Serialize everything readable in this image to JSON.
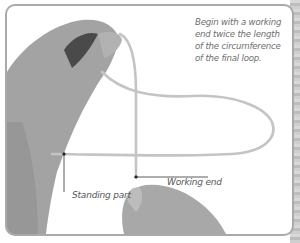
{
  "figure": {
    "caption": "Begin with a working end twice the length of the circumference of the final loop.",
    "caption_lines": [
      "Begin with a working",
      "end twice the length",
      "of the circumference",
      "of the final loop."
    ],
    "labels": {
      "standing_part": "Standing part",
      "working_end": "Working end"
    },
    "colors": {
      "frame_border": "#a9a9a9",
      "rope": "#c9c9c9",
      "hand": "#9a9a9a",
      "leader_line": "#333333",
      "caption_text": "#6e6e6e"
    }
  }
}
